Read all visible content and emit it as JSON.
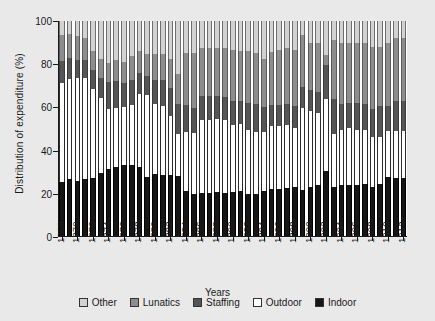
{
  "chart_data": {
    "type": "bar",
    "stacked": true,
    "stack_mode": "percent",
    "title": "",
    "xlabel": "Years",
    "ylabel": "Distribution of expenditure (%)",
    "ylim": [
      0,
      100
    ],
    "yticks": [
      0,
      20,
      40,
      60,
      80,
      100
    ],
    "grid": false,
    "legend_position": "bottom",
    "tick_label_step": 2,
    "categories": [
      "1868",
      "1869",
      "1870",
      "1871",
      "1872",
      "1873",
      "1874",
      "1875",
      "1876",
      "1877",
      "1878",
      "1879",
      "1880",
      "1881",
      "1882",
      "1883",
      "1884",
      "1885",
      "1886",
      "1887",
      "1888",
      "1889",
      "1890",
      "1891",
      "1892",
      "1893",
      "1894",
      "1895",
      "1896",
      "1897",
      "1898",
      "1899",
      "1900",
      "1901",
      "1902",
      "1903",
      "1904",
      "1905",
      "1906",
      "1907",
      "1908",
      "1909",
      "1910",
      "1911",
      "1912"
    ],
    "series": [
      {
        "name": "Indoor",
        "color": "#161616",
        "values": [
          25,
          26.5,
          25.5,
          26.5,
          27,
          29.5,
          31,
          32,
          33,
          33,
          32,
          27.5,
          29,
          28.5,
          28.5,
          28,
          21,
          19.5,
          20,
          20,
          20.5,
          20,
          20.5,
          21,
          19.5,
          19.5,
          21,
          22,
          22,
          22.5,
          23,
          21.5,
          23,
          23.5,
          30,
          23,
          23.5,
          23.5,
          23.5,
          24,
          23,
          24,
          27.5,
          27,
          27
        ]
      },
      {
        "name": "Outdoor",
        "color": "#ffffff",
        "values": [
          46,
          46.5,
          48,
          47,
          41.5,
          34.5,
          28,
          27.5,
          27,
          28,
          34,
          38,
          32.5,
          32,
          27.5,
          19.5,
          27.5,
          28.5,
          34,
          34,
          34,
          34,
          31,
          31,
          30,
          29,
          27.5,
          29,
          29,
          29,
          27,
          38,
          35,
          33.5,
          33.5,
          24.5,
          26,
          26.5,
          26,
          25.5,
          23,
          22,
          21.5,
          22,
          22
        ]
      },
      {
        "name": "Staffing",
        "color": "#555555",
        "values": [
          10.5,
          10,
          8.5,
          8.5,
          8.5,
          9.5,
          12.5,
          12.5,
          11,
          11.5,
          10,
          9,
          11,
          12,
          13,
          14,
          12.5,
          11.5,
          11,
          11,
          10.5,
          10.5,
          11.5,
          11,
          12.5,
          13,
          11.5,
          10,
          10,
          10,
          10.5,
          10,
          10,
          10,
          16,
          16,
          12,
          12,
          12.5,
          12,
          13,
          14.5,
          11.5,
          14,
          14
        ]
      },
      {
        "name": "Lunatics",
        "color": "#8d8d8d",
        "values": [
          12,
          11,
          11,
          10,
          9,
          9,
          9,
          10,
          10,
          11,
          10,
          10,
          12,
          12,
          13.5,
          14,
          24,
          25.5,
          22.5,
          22.5,
          22.5,
          23,
          23.5,
          23,
          24,
          23.5,
          22.5,
          24.5,
          25.5,
          26,
          26,
          24,
          22,
          23,
          4.5,
          27.5,
          28.5,
          28,
          28,
          28.5,
          29,
          27.5,
          29.5,
          29,
          29
        ]
      },
      {
        "name": "Other",
        "color": "#d2d2d2",
        "values": [
          6.5,
          6,
          7,
          8,
          14,
          17.5,
          19.5,
          18,
          19,
          16.5,
          14,
          15.5,
          15.5,
          15.5,
          17.5,
          24.5,
          15,
          15,
          12.5,
          12.5,
          12.5,
          12.5,
          13.5,
          14,
          14,
          15,
          17.5,
          14.5,
          13.5,
          12.5,
          13.5,
          6.5,
          10,
          10,
          16,
          9,
          10,
          10,
          10,
          10,
          12,
          12,
          10,
          8,
          8
        ]
      }
    ]
  },
  "legend": {
    "items": [
      {
        "label": "Other",
        "color": "#d2d2d2"
      },
      {
        "label": "Lunatics",
        "color": "#8d8d8d"
      },
      {
        "label": "Staffing",
        "color": "#555555"
      },
      {
        "label": "Outdoor",
        "color": "#ffffff"
      },
      {
        "label": "Indoor",
        "color": "#161616"
      }
    ]
  }
}
